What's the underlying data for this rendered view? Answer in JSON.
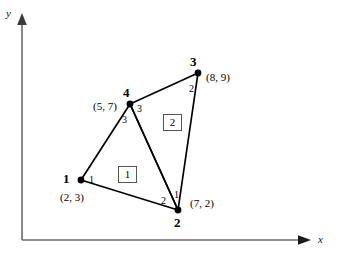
{
  "figure": {
    "kind": "finite-element-mesh-diagram",
    "axes": {
      "x_label": "x",
      "y_label": "y",
      "origin_px": [
        22,
        240
      ]
    },
    "nodes": [
      {
        "id": "1",
        "coord_text": "(2, 3)",
        "px": [
          81,
          180
        ]
      },
      {
        "id": "2",
        "coord_text": "(7, 2)",
        "px": [
          178,
          210
        ]
      },
      {
        "id": "3",
        "coord_text": "(8, 9)",
        "px": [
          198,
          73
        ]
      },
      {
        "id": "4",
        "coord_text": "(5, 7)",
        "px": [
          130,
          104
        ]
      }
    ],
    "elements": [
      {
        "id": "1",
        "box_label": "1",
        "nodes": [
          "1",
          "2",
          "4"
        ]
      },
      {
        "id": "2",
        "box_label": "2",
        "nodes": [
          "4",
          "2",
          "3"
        ]
      }
    ],
    "local_node_numbers": [
      {
        "text": "1",
        "element": "1",
        "at_node": "1"
      },
      {
        "text": "2",
        "element": "1",
        "at_node": "2"
      },
      {
        "text": "3",
        "element": "1",
        "at_node": "4"
      },
      {
        "text": "1",
        "element": "2",
        "at_node": "2"
      },
      {
        "text": "2",
        "element": "2",
        "at_node": "3"
      },
      {
        "text": "3",
        "element": "2",
        "at_node": "4"
      }
    ],
    "colors": {
      "line": "#000000",
      "axis": "#6a6a6a",
      "node_dot": "#000000",
      "element_box_border": "#555555",
      "background": "#ffffff"
    }
  }
}
